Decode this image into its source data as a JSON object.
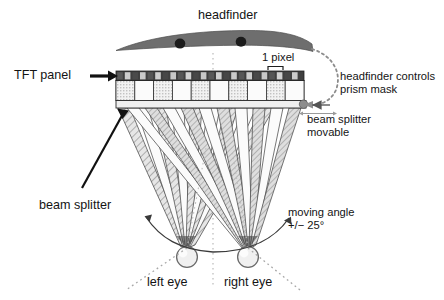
{
  "figure": {
    "type": "optical-schematic",
    "background_color": "#ffffff"
  },
  "labels": {
    "headfinder": "headfinder",
    "tft_panel": "TFT panel",
    "one_pixel": "1 pixel",
    "headfinder_controls_line1": "headfinder controls",
    "headfinder_controls_line2": "prism mask",
    "beam_splitter_movable_line1": "beam splitter",
    "beam_splitter_movable_line2": "movable",
    "beam_splitter": "beam splitter",
    "moving_angle_line1": "moving angle",
    "moving_angle_line2": "+/− 25°",
    "left_eye": "left eye",
    "right_eye": "right eye"
  },
  "components": {
    "headfinder": {
      "name": "headfinder",
      "fill": "#6e6e6e",
      "stroke": "#4a4a4a",
      "sensor_count": 2,
      "sensor_color": "#1b1b1b"
    },
    "tft_panel": {
      "name": "tft-panel",
      "pixel_cells": 22,
      "dark_cell_color": "#4c4c4c",
      "light_cell_color": "#cfcfcf",
      "border_color": "#2b2b2b"
    },
    "prism_mask": {
      "name": "prism-mask",
      "cell_count": 10,
      "hatched_fill": "#d8d8d8",
      "plain_fill": "#f4f4f4",
      "border_color": "#3a3a3a"
    },
    "beam_splitter": {
      "name": "beam-splitter",
      "fill": "#ededed",
      "border_color": "#2b2b2b",
      "movable": true,
      "node_color": "#8d8d8d"
    },
    "eyes": [
      {
        "name": "left-eye",
        "label": "left eye",
        "fill": "#f0f0f0",
        "stroke": "#6a6a6a"
      },
      {
        "name": "right-eye",
        "label": "right eye",
        "fill": "#f0f0f0",
        "stroke": "#6a6a6a"
      }
    ],
    "beams": {
      "left_fan_rays": 9,
      "right_fan_rays": 9,
      "hatched_beam_fill": "#d0d0d0",
      "plain_beam_fill": "#f7f7f7",
      "ray_stroke": "#4a4a4a"
    },
    "moving_angle": {
      "value": "+/− 25°",
      "dotted_color": "#9a9a9a"
    }
  },
  "annotations": {
    "tft_arrow": "thick-black-arrow-right",
    "beam_splitter_pointer": "diagonal-leader-line",
    "headfinder_link": "dotted-curved-arrow",
    "movable_indicator": "horizontal-double-arrow",
    "center_line": "vertical-dotted-axis"
  }
}
